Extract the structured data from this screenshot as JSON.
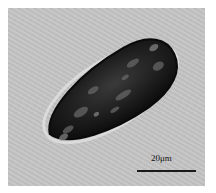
{
  "image": {
    "type": "light micrograph",
    "subject": "elongated ovoid cell with dark granular cytoplasm",
    "background_color": "#c4c4c4",
    "cell_color": "#1c1c1c",
    "halo_color": "#e8e8e8"
  },
  "scale_bar": {
    "label": "20μm"
  }
}
